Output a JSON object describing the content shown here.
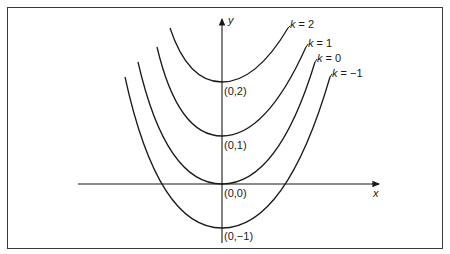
{
  "diagram": {
    "title": "",
    "axes": {
      "x_label": "x",
      "y_label": "y"
    },
    "curves": [
      {
        "k": "2",
        "label_k": "k",
        "label_eq": " = 2",
        "vertex_label": "(0,2)"
      },
      {
        "k": "1",
        "label_k": "k",
        "label_eq": " = 1",
        "vertex_label": "(0,1)"
      },
      {
        "k": "0",
        "label_k": "k",
        "label_eq": " = 0",
        "vertex_label": "(0,0)"
      },
      {
        "k": "-1",
        "label_k": "k",
        "label_eq": " = −1",
        "vertex_label": "(0,−1)"
      }
    ],
    "colors": {
      "line": "#1a1a1a",
      "frame": "#3a3a3a",
      "background": "#ffffff"
    }
  }
}
